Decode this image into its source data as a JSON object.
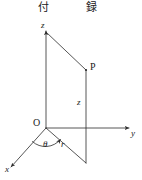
{
  "page": {
    "width": 142,
    "height": 180,
    "background": "#ffffff",
    "ink": "#1a1a1a"
  },
  "header": {
    "name": "running-head",
    "left_text": "付",
    "right_text": "録",
    "full_text": "付 録"
  },
  "figure": {
    "name": "cylindrical-coordinates-diagram",
    "stroke_color": "#2b2b2b",
    "line_width": 0.8,
    "axes": [
      {
        "id": "z",
        "label": "z",
        "from": [
          46,
          128
        ],
        "to": [
          46,
          30
        ],
        "arrow": true
      },
      {
        "id": "y",
        "label": "y",
        "from": [
          46,
          128
        ],
        "to": [
          130,
          128
        ],
        "arrow": true
      },
      {
        "id": "x",
        "label": "x",
        "from": [
          46,
          128
        ],
        "to": [
          10,
          168
        ],
        "arrow": true
      }
    ],
    "points": [
      {
        "id": "O",
        "label": "O",
        "at": [
          46,
          128
        ]
      },
      {
        "id": "P",
        "label": "P",
        "at": [
          86,
          70
        ]
      }
    ],
    "segments": [
      {
        "id": "z-top-to-P",
        "from": [
          46,
          32
        ],
        "to": [
          86,
          70
        ]
      },
      {
        "id": "P-to-base",
        "from": [
          86,
          70
        ],
        "to": [
          86,
          163
        ]
      },
      {
        "id": "O-to-base",
        "from": [
          46,
          128
        ],
        "to": [
          86,
          163
        ]
      }
    ],
    "angle_arc": {
      "id": "theta-arc",
      "center": [
        46,
        128
      ],
      "label": "θ"
    },
    "labels": [
      {
        "id": "z-axis-label",
        "text": "z",
        "at": [
          42,
          27
        ]
      },
      {
        "id": "y-axis-label",
        "text": "y",
        "at": [
          132,
          133
        ]
      },
      {
        "id": "x-axis-label",
        "text": "x",
        "at": [
          6,
          170
        ]
      },
      {
        "id": "origin-label",
        "text": "O",
        "at": [
          35,
          122
        ]
      },
      {
        "id": "point-p-label",
        "text": "P",
        "at": [
          90,
          64
        ]
      },
      {
        "id": "height-label",
        "text": "z",
        "at": [
          78,
          102
        ]
      },
      {
        "id": "theta-label",
        "text": "θ",
        "at": [
          44,
          143
        ]
      },
      {
        "id": "radius-label",
        "text": "r",
        "at": [
          61,
          143
        ]
      }
    ]
  }
}
